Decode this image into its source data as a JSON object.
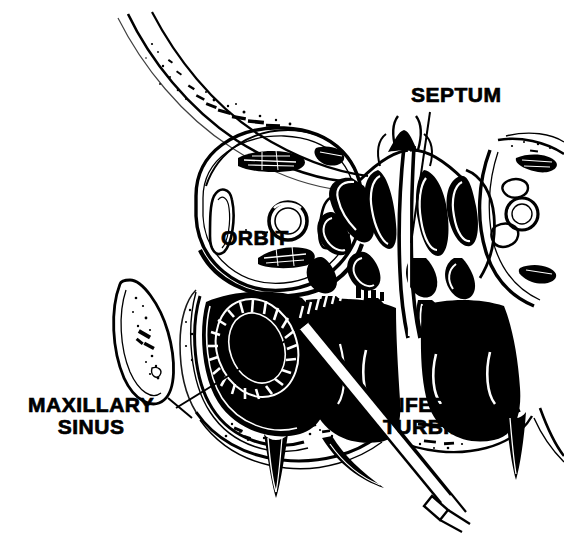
{
  "figure": {
    "kind": "anatomical-line-illustration",
    "style": "high-contrast black and white woodcut-style medical drawing",
    "background_color": "#ffffff",
    "ink_color": "#000000",
    "width": 564,
    "height": 538
  },
  "labels": [
    {
      "id": "septum",
      "text": "SEPTUM",
      "x": 411,
      "y": 84,
      "font_size": 21,
      "leader": {
        "from_x": 430,
        "from_y": 112,
        "to_x": 411,
        "to_y": 243
      }
    },
    {
      "id": "orbit",
      "text": "ORBIT",
      "x": 221,
      "y": 227,
      "font_size": 21,
      "leader": null
    },
    {
      "id": "maxillary-sinus",
      "text_line_1": "MAXILLARY",
      "text_line_2": "SINUS",
      "x": 28,
      "y": 394,
      "font_size": 21,
      "leader": {
        "from_x": 176,
        "from_y": 408,
        "to_x": 290,
        "to_y": 338
      }
    },
    {
      "id": "inferior-turbinate",
      "text_line_1": "INFERIOR",
      "text_line_2": "TURBINATE",
      "x": 383,
      "y": 394,
      "font_size": 21,
      "leader": null
    }
  ],
  "anatomy": {
    "structures": [
      "frontal-nasal-bone-band",
      "left-orbit",
      "right-orbit-partial",
      "orbital-contents-muscles",
      "optic-nerve-ring",
      "ethmoid-air-cells",
      "nasal-septum",
      "middle-turbinate",
      "inferior-turbinate",
      "nasal-cavity",
      "maxillary-sinus",
      "zygomatic-arch",
      "hard-palate",
      "tooth-roots",
      "trocar-cannula",
      "irrigation-ring"
    ]
  },
  "instrument": {
    "name": "trocar-cannula",
    "tip_x": 300,
    "tip_y": 333,
    "handle_x": 447,
    "handle_y": 510
  }
}
